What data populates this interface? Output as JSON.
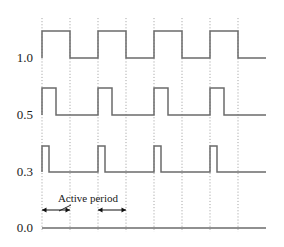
{
  "figure": {
    "background_color": "#ffffff",
    "waveform_color": "#6b6b6b",
    "gridline_color": "#9b9b9b",
    "text_color": "#1a1a1a",
    "width": 284,
    "height": 247
  },
  "axis": {
    "labels": [
      {
        "text": "1.0",
        "x": 33,
        "y": 62
      },
      {
        "text": "0.5",
        "x": 33,
        "y": 119
      },
      {
        "text": "0.3",
        "x": 33,
        "y": 176
      },
      {
        "text": "0.0",
        "x": 33,
        "y": 232
      }
    ]
  },
  "annotation": {
    "label": "Active period",
    "label_x": 88,
    "label_y": 202,
    "spans": [
      {
        "from_x": 42,
        "to_x": 70,
        "y": 210
      },
      {
        "from_x": 98,
        "to_x": 126,
        "y": 210
      }
    ],
    "leader": {
      "x1": 71,
      "y1": 205,
      "x2": 59,
      "y2": 211
    }
  },
  "chart_data": {
    "type": "line",
    "xlabel": "",
    "ylabel": "",
    "grid": true,
    "legend_position": "none",
    "x_range": [
      42,
      266
    ],
    "gridline_x_positions": [
      42,
      70,
      98,
      126,
      154,
      182,
      210,
      238
    ],
    "gridline_spacing": 28,
    "gridline_top": 18,
    "gridline_bottom": 232,
    "y_tick_labels": [
      "1.0",
      "0.5",
      "0.3",
      "0.0"
    ],
    "y_baselines": [
      58,
      115,
      172,
      228
    ],
    "series": [
      {
        "name": "1.0",
        "description": "Square wave, 50% duty cycle, period = 2 gridline intervals (56 px), high from gridlines 1-2, 3-4, 5-6, 7-8",
        "baseline_y": 58,
        "high_y": 31,
        "low_y": 58,
        "start_x": 42,
        "end_x": 266,
        "transitions": [
          {
            "x": 42,
            "level": "high"
          },
          {
            "x": 70,
            "level": "low"
          },
          {
            "x": 98,
            "level": "high"
          },
          {
            "x": 126,
            "level": "low"
          },
          {
            "x": 154,
            "level": "high"
          },
          {
            "x": 182,
            "level": "low"
          },
          {
            "x": 210,
            "level": "high"
          },
          {
            "x": 238,
            "level": "low"
          }
        ]
      },
      {
        "name": "0.5",
        "description": "Pulse train, 4 pulses of width 14 px (half a gridline interval), period 56 px, rising at gridlines 1, 3, 5, 7",
        "baseline_y": 115,
        "high_y": 88,
        "low_y": 115,
        "start_x": 42,
        "end_x": 266,
        "pulses": [
          {
            "rise_x": 42,
            "fall_x": 56
          },
          {
            "rise_x": 98,
            "fall_x": 112
          },
          {
            "rise_x": 154,
            "fall_x": 168
          },
          {
            "rise_x": 210,
            "fall_x": 224
          }
        ]
      },
      {
        "name": "0.3",
        "description": "Narrow pulse train, 4 pulses of width 7 px (quarter gridline interval), period 56 px, rising at gridlines 1, 3, 5, 7",
        "baseline_y": 172,
        "high_y": 146,
        "low_y": 172,
        "start_x": 42,
        "end_x": 266,
        "pulses": [
          {
            "rise_x": 42,
            "fall_x": 49
          },
          {
            "rise_x": 98,
            "fall_x": 105
          },
          {
            "rise_x": 154,
            "fall_x": 161
          },
          {
            "rise_x": 210,
            "fall_x": 217
          }
        ]
      },
      {
        "name": "0.0",
        "description": "Constant flat reference line at zero level",
        "baseline_y": 228,
        "high_y": 228,
        "low_y": 228,
        "start_x": 42,
        "end_x": 266,
        "transitions": []
      }
    ],
    "annotations": [
      {
        "text": "Active period",
        "type": "double-headed-arrow-pair",
        "spans_x": [
          [
            42,
            70
          ],
          [
            98,
            126
          ]
        ],
        "y": 210
      }
    ]
  }
}
